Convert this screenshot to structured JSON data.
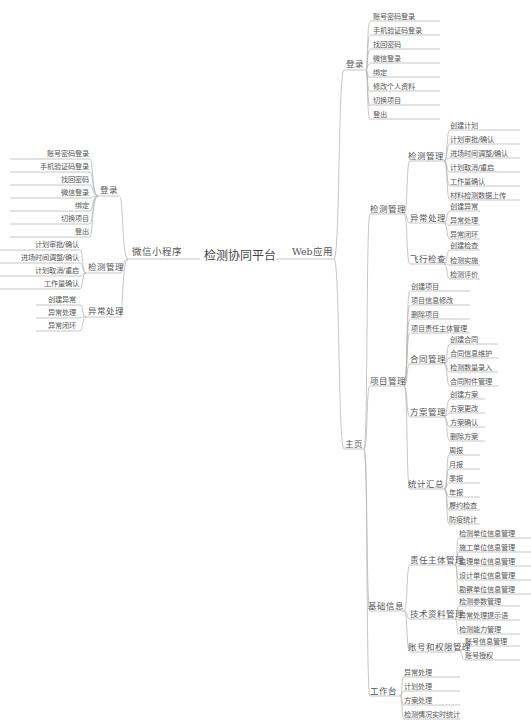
{
  "root": {
    "label": "检测协同平台"
  },
  "left": {
    "label": "微信小程序",
    "branches": [
      {
        "label": "登录",
        "items": [
          "账号密码登录",
          "手机验证码登录",
          "找回密码",
          "微信登录",
          "绑定",
          "切换项目",
          "登出"
        ]
      },
      {
        "label": "检测管理",
        "items": [
          "计划审批/确认",
          "进场时间调整/确认",
          "计划取消/重启",
          "工作量确认"
        ]
      },
      {
        "label": "异常处理",
        "items": [
          "创建异常",
          "异常处理",
          "异常闭环"
        ]
      }
    ]
  },
  "right": {
    "label": "Web应用",
    "login": {
      "label": "登录",
      "items": [
        "账号密码登录",
        "手机验证码登录",
        "找回密码",
        "微信登录",
        "绑定",
        "修改个人资料",
        "切换项目",
        "登出"
      ]
    },
    "home": {
      "label": "主页",
      "inspection": {
        "label": "检测管理",
        "groups": [
          {
            "label": "检测管理",
            "items": [
              "创建计划",
              "计划审批/确认",
              "进场时间调整/确认",
              "计划取消/重启",
              "工作量确认",
              "材料检测数据上传"
            ]
          },
          {
            "label": "异常处理",
            "items": [
              "创建异常",
              "异常处理",
              "异常闭环"
            ]
          },
          {
            "label": "飞行检查",
            "items": [
              "创建检查",
              "检测实施",
              "检测评价"
            ]
          }
        ]
      },
      "project": {
        "label": "项目管理",
        "direct": [
          "创建项目",
          "项目信息修改",
          "删除项目",
          "项目责任主体管理"
        ],
        "groups": [
          {
            "label": "合同管理",
            "items": [
              "创建合同",
              "合同信息维护",
              "检测数量录入",
              "合同附件管理"
            ]
          },
          {
            "label": "方案管理",
            "items": [
              "创建方案",
              "方案更改",
              "方案确认",
              "删除方案"
            ]
          },
          {
            "label": "统计汇总",
            "items": [
              "周报",
              "月报",
              "季报",
              "年报",
              "履约检查",
              "防疫统计"
            ]
          }
        ]
      },
      "basic": {
        "label": "基础信息",
        "groups": [
          {
            "label": "责任主体管理",
            "items": [
              "检测单位信息管理",
              "施工单位信息管理",
              "监理单位信息管理",
              "设计单位信息管理",
              "勘察单位信息管理"
            ]
          },
          {
            "label": "技术资料管理",
            "items": [
              "检测参数管理",
              "异常处理提示语",
              "检测能力管理"
            ]
          },
          {
            "label": "账号和权限管理",
            "items": [
              "账号信息管理",
              "账号授权"
            ]
          }
        ]
      },
      "workbench": {
        "label": "工作台",
        "items": [
          "异常处理",
          "计划处理",
          "方案处理",
          "检测情况实时统计"
        ]
      }
    }
  }
}
